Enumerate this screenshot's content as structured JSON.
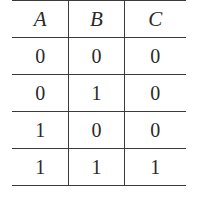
{
  "table": {
    "headers": [
      "A",
      "B",
      "C"
    ],
    "rows": [
      [
        "0",
        "0",
        "0"
      ],
      [
        "0",
        "1",
        "0"
      ],
      [
        "1",
        "0",
        "0"
      ],
      [
        "1",
        "1",
        "1"
      ]
    ]
  }
}
